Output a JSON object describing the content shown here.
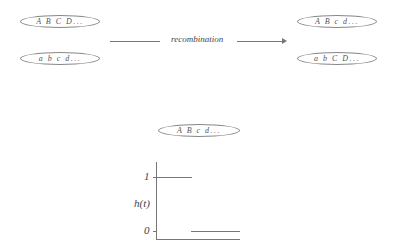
{
  "parents": [
    {
      "label": "A B C D..."
    },
    {
      "label": "a b c d..."
    }
  ],
  "process": {
    "label": "recombination"
  },
  "offspring": [
    {
      "label": "A B c d..."
    },
    {
      "label": "a b C D..."
    }
  ],
  "focus": {
    "label": "A B c d..."
  },
  "plot": {
    "ylabel": "h(t)",
    "tick_high": "1",
    "tick_low": "0"
  }
}
